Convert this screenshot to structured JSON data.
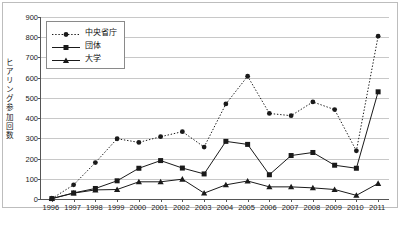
{
  "chart_data": {
    "type": "line",
    "title": "",
    "subtitle": "",
    "xlabel": "",
    "ylabel": "ヒアリング参加回数",
    "categories": [
      "1996",
      "1997",
      "1998",
      "1999",
      "2000",
      "2001",
      "2002",
      "2003",
      "2004",
      "2005",
      "2006",
      "2007",
      "2008",
      "2009",
      "2010",
      "2011"
    ],
    "ylim": [
      0,
      900
    ],
    "yticks": [
      0,
      100,
      200,
      300,
      400,
      500,
      600,
      700,
      800,
      900
    ],
    "grid": true,
    "legend_position": "top-left",
    "series": [
      {
        "name": "中央省庁",
        "marker": "circle",
        "line_style": "dotted",
        "color": "#1a1a1a",
        "values": [
          2,
          70,
          180,
          298,
          280,
          308,
          333,
          257,
          470,
          607,
          423,
          412,
          480,
          442,
          238,
          805
        ]
      },
      {
        "name": "団体",
        "marker": "square",
        "line_style": "solid",
        "color": "#1a1a1a",
        "values": [
          2,
          30,
          52,
          90,
          152,
          190,
          153,
          124,
          285,
          270,
          120,
          215,
          230,
          167,
          152,
          530
        ]
      },
      {
        "name": "大学",
        "marker": "triangle",
        "line_style": "solid",
        "color": "#1a1a1a",
        "values": [
          2,
          29,
          45,
          47,
          85,
          85,
          98,
          29,
          70,
          89,
          60,
          60,
          55,
          47,
          18,
          77
        ]
      }
    ]
  },
  "legend": {
    "entries": [
      "中央省庁",
      "団体",
      "大学"
    ]
  },
  "axis": {
    "y_tick_labels": [
      "900",
      "800",
      "700",
      "600",
      "500",
      "400",
      "300",
      "200",
      "100",
      "0"
    ],
    "x_tick_labels": [
      "1996",
      "1997",
      "1998",
      "1999",
      "2000",
      "2001",
      "2002",
      "2003",
      "2004",
      "2005",
      "2006",
      "2007",
      "2008",
      "2009",
      "2010",
      "2011"
    ],
    "y_title": "ヒアリング参加回数"
  },
  "colors": {
    "gridline": "#c8c8c8",
    "axis": "#555555",
    "frame": "#bdbdbd",
    "series": "#1a1a1a",
    "background": "#ffffff"
  }
}
